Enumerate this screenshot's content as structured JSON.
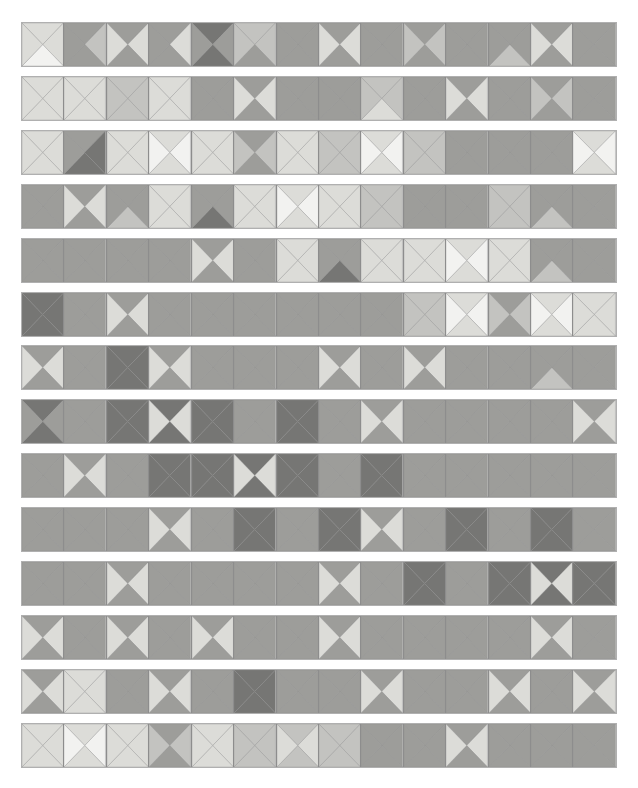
{
  "figure": {
    "type": "decorative-tiling",
    "rows": 14,
    "columns": 14,
    "canvas": {
      "width": 638,
      "height": 788,
      "background": "#ffffff"
    },
    "strip_geometry": {
      "left": 21,
      "top": 22,
      "width": 596,
      "height": 45,
      "row_pitch": 53.9,
      "cell_border_color": "#8d8d8d",
      "strip_border_color": "#b0b0b0"
    }
  },
  "palette": {
    "names": [
      "lightest",
      "light",
      "mid-light",
      "mid",
      "dark"
    ],
    "swatches": {
      "0": "#f2f2f0",
      "1": "#dcdcd8",
      "2": "#c3c3c0",
      "3": "#9d9d9a",
      "4": "#767674"
    }
  },
  "tiles": {
    "order": [
      "top",
      "right",
      "bottom",
      "left"
    ],
    "rows": [
      [
        [
          1,
          1,
          0,
          1
        ],
        [
          3,
          2,
          3,
          3
        ],
        [
          3,
          1,
          3,
          1
        ],
        [
          3,
          1,
          3,
          3
        ],
        [
          4,
          3,
          4,
          3
        ],
        [
          2,
          2,
          3,
          2
        ],
        [
          3,
          3,
          3,
          3
        ],
        [
          3,
          1,
          3,
          1
        ],
        [
          3,
          3,
          3,
          3
        ],
        [
          3,
          2,
          3,
          2
        ],
        [
          3,
          3,
          3,
          3
        ],
        [
          3,
          3,
          2,
          3
        ],
        [
          3,
          1,
          3,
          1
        ],
        [
          3,
          3,
          3,
          3
        ]
      ],
      [
        [
          1,
          1,
          1,
          1
        ],
        [
          1,
          1,
          1,
          1
        ],
        [
          2,
          2,
          2,
          2
        ],
        [
          1,
          1,
          1,
          1
        ],
        [
          3,
          3,
          3,
          3
        ],
        [
          3,
          1,
          3,
          1
        ],
        [
          3,
          3,
          3,
          3
        ],
        [
          3,
          3,
          3,
          3
        ],
        [
          2,
          2,
          1,
          2
        ],
        [
          3,
          3,
          3,
          3
        ],
        [
          3,
          1,
          3,
          1
        ],
        [
          3,
          3,
          3,
          3
        ],
        [
          3,
          2,
          3,
          2
        ],
        [
          3,
          3,
          3,
          3
        ]
      ],
      [
        [
          1,
          1,
          1,
          1
        ],
        [
          3,
          4,
          4,
          3
        ],
        [
          1,
          1,
          1,
          1
        ],
        [
          1,
          0,
          1,
          0
        ],
        [
          1,
          1,
          1,
          1
        ],
        [
          3,
          2,
          3,
          2
        ],
        [
          1,
          1,
          1,
          1
        ],
        [
          2,
          2,
          2,
          2
        ],
        [
          1,
          0,
          1,
          0
        ],
        [
          2,
          2,
          2,
          2
        ],
        [
          3,
          3,
          3,
          3
        ],
        [
          3,
          3,
          3,
          3
        ],
        [
          3,
          3,
          3,
          3
        ],
        [
          1,
          0,
          1,
          0
        ]
      ],
      [
        [
          3,
          3,
          3,
          3
        ],
        [
          3,
          1,
          3,
          1
        ],
        [
          3,
          3,
          2,
          3
        ],
        [
          1,
          1,
          1,
          1
        ],
        [
          3,
          3,
          4,
          3
        ],
        [
          1,
          1,
          1,
          1
        ],
        [
          1,
          0,
          1,
          0
        ],
        [
          1,
          1,
          1,
          1
        ],
        [
          2,
          2,
          2,
          2
        ],
        [
          3,
          3,
          3,
          3
        ],
        [
          3,
          3,
          3,
          3
        ],
        [
          2,
          2,
          2,
          2
        ],
        [
          3,
          3,
          2,
          3
        ],
        [
          3,
          3,
          3,
          3
        ]
      ],
      [
        [
          3,
          3,
          3,
          3
        ],
        [
          3,
          3,
          3,
          3
        ],
        [
          3,
          3,
          3,
          3
        ],
        [
          3,
          3,
          3,
          3
        ],
        [
          3,
          1,
          3,
          1
        ],
        [
          3,
          3,
          3,
          3
        ],
        [
          1,
          1,
          1,
          1
        ],
        [
          3,
          3,
          4,
          3
        ],
        [
          1,
          1,
          1,
          1
        ],
        [
          1,
          1,
          1,
          1
        ],
        [
          1,
          0,
          1,
          0
        ],
        [
          1,
          1,
          1,
          1
        ],
        [
          3,
          3,
          2,
          3
        ],
        [
          3,
          3,
          3,
          3
        ]
      ],
      [
        [
          4,
          4,
          4,
          4
        ],
        [
          3,
          3,
          3,
          3
        ],
        [
          3,
          1,
          3,
          1
        ],
        [
          3,
          3,
          3,
          3
        ],
        [
          3,
          3,
          3,
          3
        ],
        [
          3,
          3,
          3,
          3
        ],
        [
          3,
          3,
          3,
          3
        ],
        [
          3,
          3,
          3,
          3
        ],
        [
          3,
          3,
          3,
          3
        ],
        [
          2,
          2,
          2,
          2
        ],
        [
          1,
          0,
          1,
          0
        ],
        [
          3,
          2,
          3,
          2
        ],
        [
          1,
          0,
          1,
          0
        ],
        [
          1,
          1,
          1,
          1
        ]
      ],
      [
        [
          3,
          1,
          3,
          1
        ],
        [
          3,
          3,
          3,
          3
        ],
        [
          4,
          4,
          4,
          4
        ],
        [
          3,
          1,
          3,
          1
        ],
        [
          3,
          3,
          3,
          3
        ],
        [
          3,
          3,
          3,
          3
        ],
        [
          3,
          3,
          3,
          3
        ],
        [
          3,
          1,
          3,
          1
        ],
        [
          3,
          3,
          3,
          3
        ],
        [
          3,
          1,
          3,
          1
        ],
        [
          3,
          3,
          3,
          3
        ],
        [
          3,
          3,
          3,
          3
        ],
        [
          3,
          3,
          2,
          3
        ],
        [
          3,
          3,
          3,
          3
        ]
      ],
      [
        [
          4,
          3,
          4,
          3
        ],
        [
          3,
          3,
          3,
          3
        ],
        [
          4,
          4,
          4,
          4
        ],
        [
          4,
          1,
          4,
          1
        ],
        [
          4,
          4,
          4,
          4
        ],
        [
          3,
          3,
          3,
          3
        ],
        [
          4,
          4,
          4,
          4
        ],
        [
          3,
          3,
          3,
          3
        ],
        [
          3,
          1,
          3,
          1
        ],
        [
          3,
          3,
          3,
          3
        ],
        [
          3,
          3,
          3,
          3
        ],
        [
          3,
          3,
          3,
          3
        ],
        [
          3,
          3,
          3,
          3
        ],
        [
          3,
          1,
          3,
          1
        ]
      ],
      [
        [
          3,
          3,
          3,
          3
        ],
        [
          3,
          1,
          3,
          1
        ],
        [
          3,
          3,
          3,
          3
        ],
        [
          4,
          4,
          4,
          4
        ],
        [
          4,
          4,
          4,
          4
        ],
        [
          4,
          1,
          4,
          1
        ],
        [
          4,
          4,
          4,
          4
        ],
        [
          3,
          3,
          3,
          3
        ],
        [
          4,
          4,
          4,
          4
        ],
        [
          3,
          3,
          3,
          3
        ],
        [
          3,
          3,
          3,
          3
        ],
        [
          3,
          3,
          3,
          3
        ],
        [
          3,
          3,
          3,
          3
        ],
        [
          3,
          3,
          3,
          3
        ]
      ],
      [
        [
          3,
          3,
          3,
          3
        ],
        [
          3,
          3,
          3,
          3
        ],
        [
          3,
          3,
          3,
          3
        ],
        [
          3,
          1,
          3,
          1
        ],
        [
          3,
          3,
          3,
          3
        ],
        [
          4,
          4,
          4,
          4
        ],
        [
          3,
          3,
          3,
          3
        ],
        [
          4,
          4,
          4,
          4
        ],
        [
          3,
          1,
          3,
          1
        ],
        [
          3,
          3,
          3,
          3
        ],
        [
          4,
          4,
          4,
          4
        ],
        [
          3,
          3,
          3,
          3
        ],
        [
          4,
          4,
          4,
          4
        ],
        [
          3,
          3,
          3,
          3
        ]
      ],
      [
        [
          3,
          3,
          3,
          3
        ],
        [
          3,
          3,
          3,
          3
        ],
        [
          3,
          1,
          3,
          1
        ],
        [
          3,
          3,
          3,
          3
        ],
        [
          3,
          3,
          3,
          3
        ],
        [
          3,
          3,
          3,
          3
        ],
        [
          3,
          3,
          3,
          3
        ],
        [
          3,
          1,
          3,
          1
        ],
        [
          3,
          3,
          3,
          3
        ],
        [
          4,
          4,
          4,
          4
        ],
        [
          3,
          3,
          3,
          3
        ],
        [
          4,
          4,
          4,
          4
        ],
        [
          4,
          1,
          4,
          1
        ],
        [
          4,
          4,
          4,
          4
        ]
      ],
      [
        [
          3,
          1,
          3,
          1
        ],
        [
          3,
          3,
          3,
          3
        ],
        [
          3,
          1,
          3,
          1
        ],
        [
          3,
          3,
          3,
          3
        ],
        [
          3,
          1,
          3,
          1
        ],
        [
          3,
          3,
          3,
          3
        ],
        [
          3,
          3,
          3,
          3
        ],
        [
          3,
          1,
          3,
          1
        ],
        [
          3,
          3,
          3,
          3
        ],
        [
          3,
          3,
          3,
          3
        ],
        [
          3,
          3,
          3,
          3
        ],
        [
          3,
          3,
          3,
          3
        ],
        [
          3,
          1,
          3,
          1
        ],
        [
          3,
          3,
          3,
          3
        ]
      ],
      [
        [
          3,
          1,
          3,
          1
        ],
        [
          1,
          1,
          1,
          1
        ],
        [
          3,
          3,
          3,
          3
        ],
        [
          3,
          1,
          3,
          1
        ],
        [
          3,
          3,
          3,
          3
        ],
        [
          4,
          4,
          4,
          4
        ],
        [
          3,
          3,
          3,
          3
        ],
        [
          3,
          3,
          3,
          3
        ],
        [
          3,
          1,
          3,
          1
        ],
        [
          3,
          3,
          3,
          3
        ],
        [
          3,
          3,
          3,
          3
        ],
        [
          3,
          1,
          3,
          1
        ],
        [
          3,
          3,
          3,
          3
        ],
        [
          3,
          1,
          3,
          1
        ]
      ],
      [
        [
          1,
          1,
          1,
          1
        ],
        [
          1,
          0,
          1,
          0
        ],
        [
          1,
          1,
          1,
          1
        ],
        [
          3,
          2,
          3,
          2
        ],
        [
          1,
          1,
          1,
          1
        ],
        [
          2,
          2,
          2,
          2
        ],
        [
          2,
          1,
          2,
          1
        ],
        [
          2,
          2,
          2,
          2
        ],
        [
          3,
          3,
          3,
          3
        ],
        [
          3,
          3,
          3,
          3
        ],
        [
          3,
          1,
          3,
          1
        ],
        [
          3,
          3,
          3,
          3
        ],
        [
          3,
          3,
          3,
          3
        ],
        [
          3,
          3,
          3,
          3
        ]
      ]
    ]
  }
}
